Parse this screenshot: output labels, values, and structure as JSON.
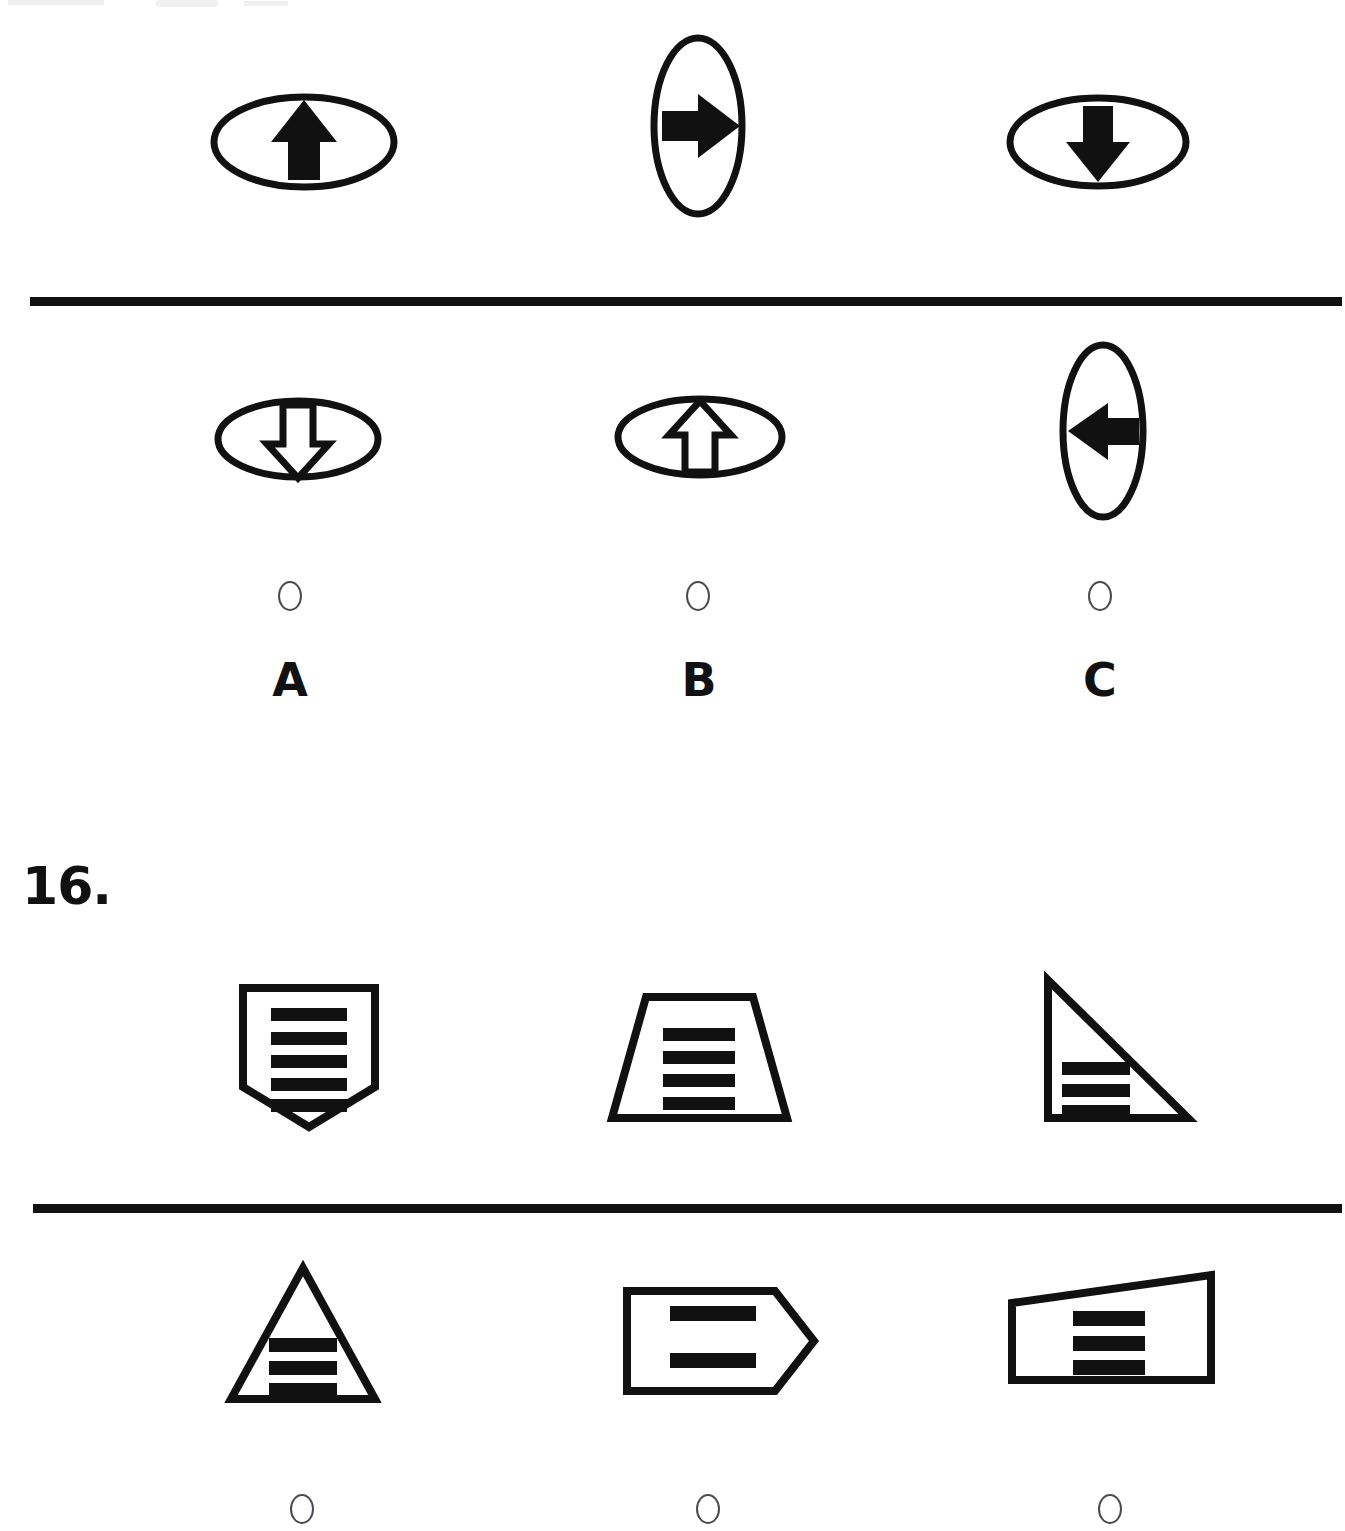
{
  "document": {
    "type": "printed-test-worksheet",
    "background_color": "#ffffff",
    "ink_color": "#111111",
    "width": 1345,
    "height": 1531
  },
  "partial_question_top": {
    "number_label": "",
    "prompt_row": {
      "name": "question-15-prompt-row",
      "items": [
        {
          "id": "q15-prompt-1",
          "container_shape": "ellipse-horizontal",
          "inner_icon": "arrow-up-solid-icon",
          "fill": "solid",
          "direction": "up"
        },
        {
          "id": "q15-prompt-2",
          "container_shape": "ellipse-vertical",
          "inner_icon": "arrow-right-solid-icon",
          "fill": "solid",
          "direction": "right"
        },
        {
          "id": "q15-prompt-3",
          "container_shape": "ellipse-horizontal",
          "inner_icon": "arrow-down-solid-icon",
          "fill": "solid",
          "direction": "down"
        }
      ]
    },
    "answer_row": {
      "name": "question-15-answer-row",
      "items": [
        {
          "id": "q15-option-a",
          "letter": "A",
          "container_shape": "ellipse-horizontal",
          "inner_icon": "arrow-down-outline-icon",
          "fill": "outline",
          "direction": "down",
          "selected": false
        },
        {
          "id": "q15-option-b",
          "letter": "B",
          "container_shape": "ellipse-horizontal",
          "inner_icon": "arrow-up-outline-icon",
          "fill": "outline",
          "direction": "up",
          "selected": false
        },
        {
          "id": "q15-option-c",
          "letter": "C",
          "container_shape": "ellipse-vertical",
          "inner_icon": "arrow-left-solid-icon",
          "fill": "solid",
          "direction": "left",
          "selected": false
        }
      ]
    }
  },
  "question_16": {
    "number_label": "16.",
    "prompt_row": {
      "name": "question-16-prompt-row",
      "items": [
        {
          "id": "q16-prompt-1",
          "shape": "shield-pentagon",
          "stripe_count": 5,
          "stripe_orientation": "horizontal"
        },
        {
          "id": "q16-prompt-2",
          "shape": "trapezoid",
          "stripe_count": 4,
          "stripe_orientation": "horizontal"
        },
        {
          "id": "q16-prompt-3",
          "shape": "right-triangle",
          "stripe_count": 3,
          "stripe_orientation": "horizontal"
        }
      ]
    },
    "answer_row": {
      "name": "question-16-answer-row",
      "items": [
        {
          "id": "q16-option-a",
          "letter": "",
          "shape": "triangle",
          "stripe_count": 3,
          "stripe_orientation": "horizontal",
          "selected": false
        },
        {
          "id": "q16-option-b",
          "letter": "",
          "shape": "arrow-pentagon-right",
          "stripe_count": 2,
          "stripe_orientation": "horizontal",
          "selected": false
        },
        {
          "id": "q16-option-c",
          "letter": "",
          "shape": "irregular-quadrilateral",
          "stripe_count": 3,
          "stripe_orientation": "horizontal",
          "selected": false
        }
      ]
    }
  },
  "dividers": [
    {
      "id": "divider-top",
      "y": 297,
      "x": 30,
      "width": 1312,
      "thickness": 9
    },
    {
      "id": "divider-bottom",
      "y": 1204,
      "x": 33,
      "width": 1309,
      "thickness": 9
    }
  ],
  "colors": {
    "ink": "#111111",
    "radio_outline": "#4a4a52",
    "paper": "#ffffff"
  }
}
